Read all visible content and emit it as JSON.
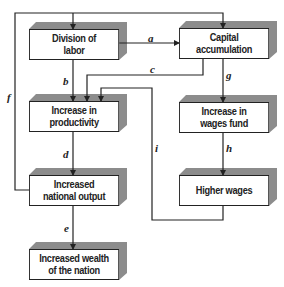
{
  "diagram": {
    "boxes": {
      "division_of_labor": "Division of\nlabor",
      "capital_accumulation": "Capital\naccumulation",
      "increase_in_productivity": "Increase in\nproductivity",
      "increase_in_wages_fund": "Increase in\nwages fund",
      "increased_national_output": "Increased\nnational output",
      "higher_wages": "Higher wages",
      "increased_wealth_of_the_nation": "Increased wealth\nof the nation"
    },
    "edge_labels": {
      "a": "a",
      "b": "b",
      "c": "c",
      "d": "d",
      "e": "e",
      "f": "f",
      "g": "g",
      "h": "h",
      "i": "i"
    },
    "edges": [
      {
        "label": "a",
        "from": "Division of labor",
        "to": "Capital accumulation"
      },
      {
        "label": "b",
        "from": "Division of labor",
        "to": "Increase in productivity"
      },
      {
        "label": "c",
        "from": "Capital accumulation",
        "to": "Increase in productivity"
      },
      {
        "label": "d",
        "from": "Increase in productivity",
        "to": "Increased national output"
      },
      {
        "label": "e",
        "from": "Increased national output",
        "to": "Increased wealth of the nation"
      },
      {
        "label": "f",
        "from": "Increased national output",
        "to": "Division of labor / Capital accumulation"
      },
      {
        "label": "g",
        "from": "Capital accumulation",
        "to": "Increase in wages fund"
      },
      {
        "label": "h",
        "from": "Increase in wages fund",
        "to": "Higher wages"
      },
      {
        "label": "i",
        "from": "Higher wages",
        "to": "Increase in productivity"
      }
    ],
    "colors": {
      "line": "#222222",
      "shadow": "#8c8c8c",
      "box_fill": "#ffffff"
    }
  }
}
